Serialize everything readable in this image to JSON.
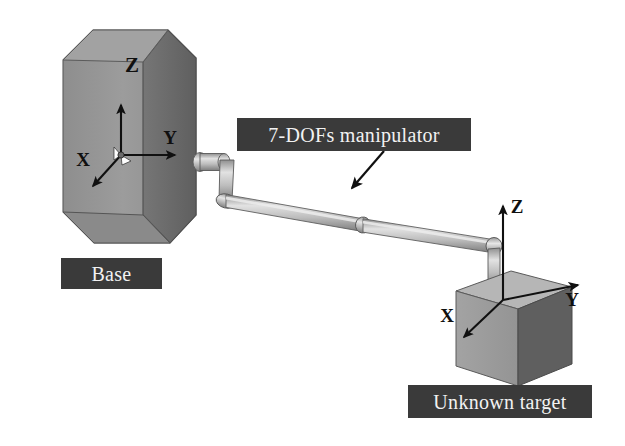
{
  "figure": {
    "background_color": "#ffffff"
  },
  "labels": {
    "base": "Base",
    "manipulator": "7-DOFs manipulator",
    "unknown_target": "Unknown target",
    "box_fill": "#3a3a3a",
    "box_text_color": "#f2f2f2"
  },
  "base_frame": {
    "axis_z": "Z",
    "axis_y": "Y",
    "axis_x": "X",
    "top_letter_z": "Z"
  },
  "target_frame": {
    "axis_z": "Z",
    "axis_y": "Y",
    "axis_x": "X"
  },
  "colors": {
    "base_front_face": "#9a9a9a",
    "base_side_face": "#6e6e6e",
    "base_top_face": "#a5a5a5",
    "target_top_face": "#b4b4b4",
    "target_left_face": "#9c9c9c",
    "target_right_face": "#5e5e5e",
    "link_light": "#d8d8d8",
    "link_mid": "#a8a8a8",
    "link_dark": "#7a7a7a",
    "outline": "#4a4a4a",
    "axis_line": "#101010"
  }
}
